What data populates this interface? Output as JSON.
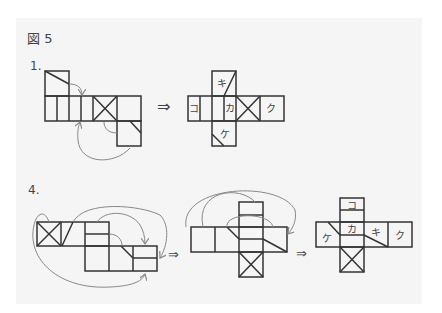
{
  "figure_title": "図 5",
  "problems": [
    {
      "label": "1.",
      "steps": [
        "unfolded net",
        "refolded net"
      ],
      "arrow": "⇒",
      "result_labels": {
        "ko": "コ",
        "ki": "キ",
        "ka": "カ",
        "ke": "ケ",
        "ku": "ク"
      }
    },
    {
      "label": "4.",
      "steps": [
        "unfolded net",
        "intermediate net",
        "refolded net"
      ],
      "arrow": "⇒",
      "result_labels": {
        "ko": "コ",
        "ke": "ケ",
        "ka": "カ",
        "ki": "キ",
        "ku": "ク"
      }
    }
  ],
  "colors": {
    "panel": "#f5f5f5",
    "line": "#333333",
    "arrow": "#888888"
  }
}
